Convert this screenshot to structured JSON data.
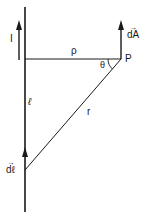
{
  "diagram": {
    "labels": {
      "current": "I",
      "rho": "ρ",
      "theta": "θ",
      "point": "P",
      "length": "ℓ",
      "r": "r",
      "dA": "dA",
      "dl": "dℓ",
      "vector_arrow": "→"
    },
    "colors": {
      "line": "#1a1a1a",
      "background": "#ffffff"
    }
  }
}
